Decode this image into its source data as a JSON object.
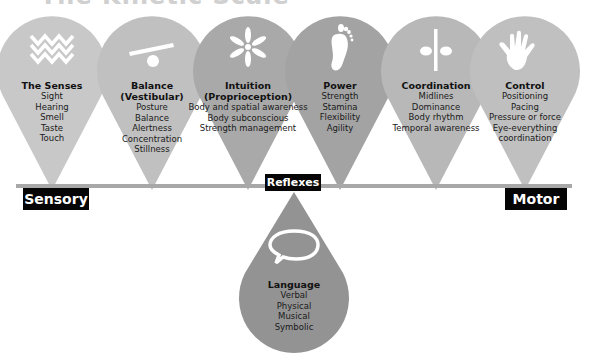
{
  "title": "The Kinetic Scale",
  "axis": {
    "left_label": "Sensory",
    "center_label": "Reflexes",
    "right_label": "Motor",
    "line_color": "#a8a8a8"
  },
  "drops": [
    {
      "icon": "waves-icon",
      "heading": "The Senses",
      "items": [
        "Sight",
        "Hearing",
        "Smell",
        "Taste",
        "Touch"
      ],
      "color": "#bdbdbd"
    },
    {
      "icon": "seesaw-icon",
      "heading": "Balance\n(Vestibular)",
      "heading_lines": [
        "Balance",
        "(Vestibular)"
      ],
      "items": [
        "Posture",
        "Balance",
        "Alertness",
        "Concentration",
        "Stillness"
      ],
      "color": "#b5b5b5"
    },
    {
      "icon": "asterisk-icon",
      "heading_lines": [
        "Intuition",
        "(Proprioception)"
      ],
      "items": [
        "Body and spatial awareness",
        "Body subconscious",
        "Strength management"
      ],
      "color": "#9c9c9c"
    },
    {
      "icon": "footprint-icon",
      "heading_lines": [
        "Power"
      ],
      "items": [
        "Strength",
        "Stamina",
        "Flexibility",
        "Agility"
      ],
      "color": "#979797"
    },
    {
      "icon": "midline-icon",
      "heading_lines": [
        "Coordination"
      ],
      "items": [
        "Midlines",
        "Dominance",
        "Body rhythm",
        "Temporal awareness"
      ],
      "color": "#ababab"
    },
    {
      "icon": "hand-icon",
      "heading_lines": [
        "Control"
      ],
      "items": [
        "Positioning",
        "Pacing",
        "Pressure or force",
        "Eye-everything",
        "coordination"
      ],
      "color": "#b3b3b3"
    }
  ],
  "language": {
    "icon": "speech-bubble-icon",
    "heading": "Language",
    "items": [
      "Verbal",
      "Physical",
      "Musical",
      "Symbolic"
    ],
    "color": "#939393"
  }
}
